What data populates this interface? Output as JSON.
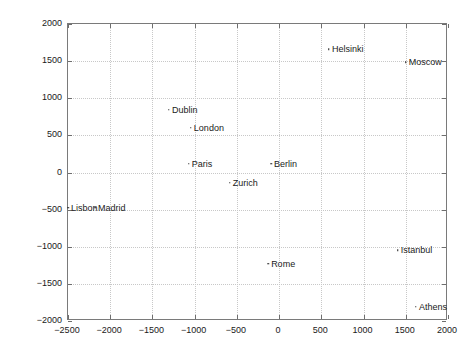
{
  "chart_data": {
    "type": "scatter",
    "title": "",
    "xlabel": "",
    "ylabel": "",
    "xlim": [
      -2500,
      2000
    ],
    "ylim": [
      -2000,
      2000
    ],
    "grid": true,
    "legend": "none",
    "xticks": [
      -2500,
      -2000,
      -1500,
      -1000,
      -500,
      0,
      500,
      1000,
      1500,
      2000
    ],
    "xtick_labels": [
      "−2500",
      "−2000",
      "−1500",
      "−1000",
      "−500",
      "0",
      "500",
      "1000",
      "1500",
      "2000"
    ],
    "yticks": [
      -2000,
      -1500,
      -1000,
      -500,
      0,
      500,
      1000,
      1500,
      2000
    ],
    "ytick_labels": [
      "−2000",
      "−1500",
      "−1000",
      "−500",
      "0",
      "500",
      "1000",
      "1500",
      "2000"
    ],
    "marker_color": "#1a1a1a",
    "grid_color": "#c8c8c8",
    "axis_color": "#7a7a7a",
    "points": [
      {
        "label": "Helsinki",
        "x": 590,
        "y": 1660
      },
      {
        "label": "Moscow",
        "x": 1500,
        "y": 1485
      },
      {
        "label": "Dublin",
        "x": -1305,
        "y": 845
      },
      {
        "label": "London",
        "x": -1045,
        "y": 600
      },
      {
        "label": "Paris",
        "x": -1070,
        "y": 115
      },
      {
        "label": "Berlin",
        "x": -95,
        "y": 115
      },
      {
        "label": "Zurich",
        "x": -585,
        "y": -140
      },
      {
        "label": "Lisbon",
        "x": -2500,
        "y": -475
      },
      {
        "label": "Madrid",
        "x": -2180,
        "y": -475
      },
      {
        "label": "Istanbul",
        "x": 1405,
        "y": -1045
      },
      {
        "label": "Rome",
        "x": -130,
        "y": -1230
      },
      {
        "label": "Athens",
        "x": 1620,
        "y": -1810
      }
    ]
  }
}
